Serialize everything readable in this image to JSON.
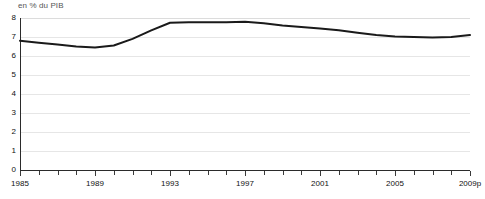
{
  "chart_data": {
    "type": "line",
    "title": "",
    "subtitle": "",
    "unit_label": "en % du PIB",
    "xlabel": "",
    "ylabel": "",
    "ylim": [
      0,
      8
    ],
    "ytick_values": [
      0,
      1,
      2,
      3,
      4,
      5,
      6,
      7,
      8
    ],
    "ytick_labels": [
      "0",
      "1",
      "2",
      "3",
      "4",
      "5",
      "6",
      "7",
      "8"
    ],
    "grid": true,
    "grid_axis": "y",
    "legend": false,
    "legend_position": "none",
    "x": [
      1985,
      1986,
      1987,
      1988,
      1989,
      1990,
      1991,
      1992,
      1993,
      1994,
      1995,
      1996,
      1997,
      1998,
      1999,
      2000,
      2001,
      2002,
      2003,
      2004,
      2005,
      2006,
      2007,
      2008,
      2009
    ],
    "xtick_labels": [
      "1985",
      "",
      "",
      "",
      "1989",
      "",
      "",
      "",
      "1993",
      "",
      "",
      "",
      "1997",
      "",
      "",
      "",
      "2001",
      "",
      "",
      "",
      "2005",
      "",
      "",
      "",
      "2009p"
    ],
    "xtick_labeled_positions": [
      1985,
      1989,
      1993,
      1997,
      2001,
      2005,
      2009
    ],
    "xtick_labeled_text": [
      "1985",
      "1989",
      "1993",
      "1997",
      "2001",
      "2005",
      "2009p"
    ],
    "series": [
      {
        "name": "",
        "color": "#1a1a1a",
        "line_width": 2,
        "values": [
          6.8,
          6.7,
          6.6,
          6.5,
          6.45,
          6.55,
          6.9,
          7.35,
          7.75,
          7.78,
          7.78,
          7.78,
          7.8,
          7.72,
          7.6,
          7.52,
          7.45,
          7.35,
          7.22,
          7.1,
          7.02,
          7.0,
          6.98,
          7.0,
          7.1
        ]
      }
    ]
  }
}
